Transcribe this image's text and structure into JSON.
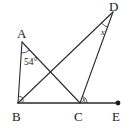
{
  "figure": {
    "background_color": "#ffffff",
    "stroke_color": "#2b2b2b",
    "text_color": "#1a1a1a",
    "width": 130,
    "height": 128
  },
  "points": {
    "A": {
      "label": "A",
      "x": 22,
      "y": 42,
      "label_x": 17,
      "label_y": 38
    },
    "B": {
      "label": "B",
      "x": 18,
      "y": 103,
      "label_x": 12,
      "label_y": 121
    },
    "C": {
      "label": "C",
      "x": 80,
      "y": 103,
      "label_x": 74,
      "label_y": 121
    },
    "D": {
      "label": "D",
      "x": 113,
      "y": 12,
      "label_x": 109,
      "label_y": 11
    },
    "E": {
      "label": "E",
      "x": 118,
      "y": 103,
      "label_x": 112,
      "label_y": 121
    }
  },
  "segments": [
    {
      "name": "segment-ab",
      "from": "A",
      "to": "B"
    },
    {
      "name": "segment-ac",
      "from": "A",
      "to": "C"
    },
    {
      "name": "segment-bd",
      "from": "B",
      "to": "D"
    },
    {
      "name": "segment-cd",
      "from": "C",
      "to": "D"
    },
    {
      "name": "segment-baseline-be",
      "from": "B",
      "to": "E"
    }
  ],
  "angles": [
    {
      "name": "angle-at-a",
      "vertex": "A",
      "label": "54°",
      "label_x": 24,
      "label_y": 65,
      "style": "degrees",
      "value": 54
    },
    {
      "name": "angle-at-b",
      "vertex": "B",
      "label": "o",
      "label_x": 21,
      "label_y": 102,
      "style": "small-mark",
      "value": null
    },
    {
      "name": "angle-at-c",
      "vertex": "C",
      "label": "x",
      "label_x": 82,
      "label_y": 102,
      "style": "variable",
      "value": null
    },
    {
      "name": "angle-at-d",
      "vertex": "D",
      "label": "x",
      "label_x": 101,
      "label_y": 35,
      "style": "variable",
      "value": null
    }
  ],
  "markers": [
    {
      "name": "point-marker-e",
      "at": "E",
      "radius": 2.4
    }
  ]
}
